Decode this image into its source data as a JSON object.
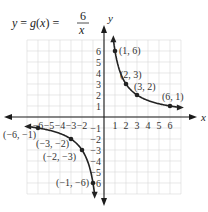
{
  "chart_data": {
    "type": "line",
    "title_parts": {
      "lhs": "y = g(x) =",
      "numerator": "6",
      "denominator": "x"
    },
    "xlabel": "x",
    "ylabel": "y",
    "xlim": [
      -7,
      7
    ],
    "ylim": [
      -7,
      7
    ],
    "grid": true,
    "x_ticks": [
      -6,
      -5,
      -4,
      -3,
      -2,
      1,
      2,
      3,
      4,
      5,
      6
    ],
    "y_ticks": [
      -6,
      -5,
      -4,
      -3,
      -2,
      -1,
      1,
      2,
      3,
      4,
      5,
      6
    ],
    "x_tick_labels": [
      "-6",
      "-5",
      "-4",
      "-3",
      "-2",
      "1",
      "2",
      "3",
      "4",
      "5",
      "6"
    ],
    "y_tick_labels": [
      "-6",
      "-5",
      "-4",
      "-3",
      "-2",
      "-1",
      "1",
      "2",
      "3",
      "4",
      "5",
      "6"
    ],
    "series": [
      {
        "name": "g(x)=6/x, x>0",
        "function": "6/x",
        "domain": [
          0.85,
          6.9
        ]
      },
      {
        "name": "g(x)=6/x, x<0",
        "function": "6/x",
        "domain": [
          -6.9,
          -0.85
        ]
      }
    ],
    "points": [
      {
        "x": 1,
        "y": 6,
        "label": "(1, 6)"
      },
      {
        "x": 2,
        "y": 3,
        "label": "(2, 3)"
      },
      {
        "x": 3,
        "y": 2,
        "label": "(3, 2)"
      },
      {
        "x": 6,
        "y": 1,
        "label": "(6, 1)"
      },
      {
        "x": -6,
        "y": -1,
        "label": "(−6, −1)"
      },
      {
        "x": -3,
        "y": -2,
        "label": "(−3, −2)"
      },
      {
        "x": -2,
        "y": -3,
        "label": "(−2, −3)"
      },
      {
        "x": -1,
        "y": -6,
        "label": "(−1, −6)"
      }
    ]
  },
  "layout": {
    "origin_px": [
      104,
      117
    ],
    "unit_px": 11
  }
}
